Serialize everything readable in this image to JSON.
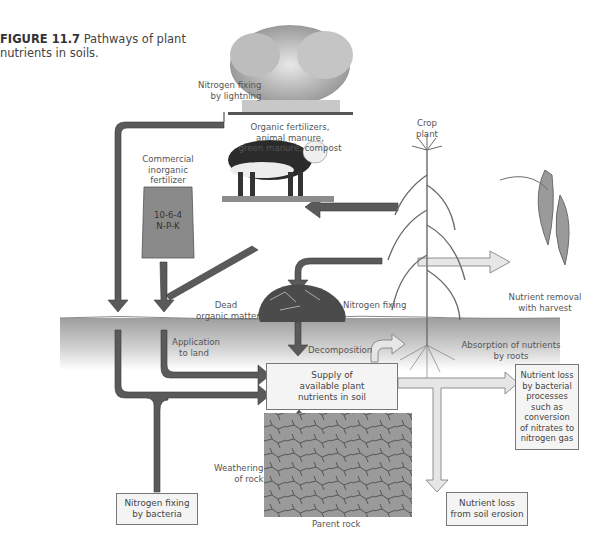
{
  "figure": {
    "number": "FIGURE 11.7",
    "title": "Pathways of plant nutrients in soils.",
    "title_line1": "Pathways of plant",
    "title_line2": "nutrients in soils."
  },
  "labels": {
    "lightning_1": "Nitrogen fixing",
    "lightning_2": "by lightning",
    "organic_1": "Organic fertilizers,",
    "organic_2": "animal manure,",
    "organic_3": "green manure, compost",
    "commercial_1": "Commercial",
    "commercial_2": "inorganic",
    "commercial_3": "fertilizer",
    "bag_1": "10-6-4",
    "bag_2": "N-P-K",
    "crop_1": "Crop",
    "crop_2": "plant",
    "harvest_1": "Nutrient removal",
    "harvest_2": "with harvest",
    "dead_1": "Dead",
    "dead_2": "organic matter",
    "nfixing": "Nitrogen fixing",
    "application_1": "Application",
    "application_2": "to land",
    "decomposition": "Decomposition",
    "absorption_1": "Absorption of nutrients",
    "absorption_2": "by roots",
    "weathering_1": "Weathering",
    "weathering_2": "of rock",
    "parent_rock": "Parent rock"
  },
  "boxes": {
    "supply": [
      "Supply of",
      "available plant",
      "nutrients in soil"
    ],
    "bacterial_loss": [
      "Nutrient loss",
      "by bacterial",
      "processes",
      "such as",
      "conversion",
      "of nitrates to",
      "nitrogen gas"
    ],
    "erosion_loss": [
      "Nutrient loss",
      "from soil erosion"
    ],
    "bacteria_fixing": [
      "Nitrogen fixing",
      "by bacteria"
    ]
  },
  "colors": {
    "dark_arrow": "#5a5a5a",
    "light_arrow": "#e6e6e6",
    "soil_band": "#b5b5b5",
    "bag": "#8a8a8a"
  }
}
